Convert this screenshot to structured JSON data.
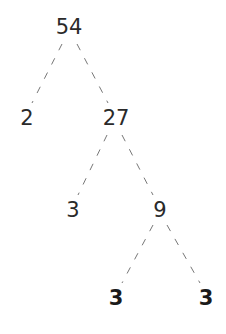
{
  "diagram": {
    "type": "factor-tree",
    "edge_style": "dashed",
    "edge_color": "#777777",
    "text_color": "#2a2a2a",
    "nodes": [
      {
        "id": "n54",
        "label": "54",
        "x": 69,
        "y": 27,
        "bold": false
      },
      {
        "id": "n2",
        "label": "2",
        "x": 27,
        "y": 118,
        "bold": false
      },
      {
        "id": "n27",
        "label": "27",
        "x": 116,
        "y": 118,
        "bold": false
      },
      {
        "id": "n3a",
        "label": "3",
        "x": 73,
        "y": 210,
        "bold": false
      },
      {
        "id": "n9",
        "label": "9",
        "x": 160,
        "y": 210,
        "bold": false
      },
      {
        "id": "n3b",
        "label": "3",
        "x": 116,
        "y": 298,
        "bold": true
      },
      {
        "id": "n3c",
        "label": "3",
        "x": 206,
        "y": 298,
        "bold": true
      }
    ],
    "edges": [
      {
        "from": "n54",
        "to": "n2"
      },
      {
        "from": "n54",
        "to": "n27"
      },
      {
        "from": "n27",
        "to": "n3a"
      },
      {
        "from": "n27",
        "to": "n9"
      },
      {
        "from": "n9",
        "to": "n3b"
      },
      {
        "from": "n9",
        "to": "n3c"
      }
    ]
  }
}
